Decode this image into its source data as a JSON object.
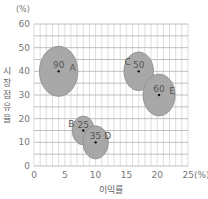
{
  "chart_data": {
    "type": "scatter",
    "subtype": "bubble",
    "title": "",
    "xlabel": "이익률",
    "ylabel": "시장점유율",
    "x_unit": "(%)",
    "y_unit": "(%)",
    "xlim": [
      0,
      25
    ],
    "ylim": [
      0,
      60
    ],
    "x_ticks": [
      "0",
      "5",
      "10",
      "15",
      "20",
      "25(%)"
    ],
    "y_ticks": [
      "0",
      "10",
      "20",
      "30",
      "40",
      "50",
      "60"
    ],
    "grid": true,
    "legend": "none",
    "points": [
      {
        "name": "A",
        "x": 4,
        "y": 40,
        "size": 90
      },
      {
        "name": "B",
        "x": 8,
        "y": 15,
        "size": 25
      },
      {
        "name": "C",
        "x": 17,
        "y": 40,
        "size": 50
      },
      {
        "name": "D",
        "x": 10,
        "y": 10,
        "size": 35
      },
      {
        "name": "E",
        "x": 20.3,
        "y": 30,
        "size": 60
      }
    ],
    "colors": {
      "bubble_fill": "#a8a8a8",
      "bubble_stroke": "#8a8a8a",
      "grid": "#c8c8c8",
      "grid_major": "#b0b0b0"
    }
  }
}
